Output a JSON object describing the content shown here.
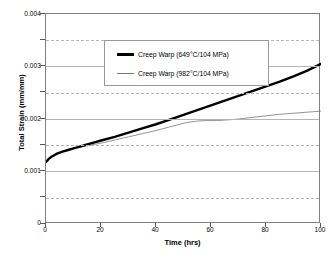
{
  "figure": {
    "background": "#ffffff",
    "frame_color": "#808080",
    "grid_major_color": "#b4b4b4",
    "grid_minor_color": "#b4b4b4"
  },
  "axes": {
    "x_title": "Time (hrs)",
    "y_title": "Total Strain (mm/mm)",
    "x_ticks": [
      "0",
      "20",
      "40",
      "60",
      "80",
      "100"
    ],
    "y_ticks": [
      "0",
      "0.001",
      "0.002",
      "0.003",
      "0.004"
    ]
  },
  "legend": {
    "entries": [
      {
        "label": "Creep Warp (649°C/104 MPa)",
        "style": "thick",
        "color": "#000000"
      },
      {
        "label": "Creep Warp (982°C/104 MPa)",
        "style": "thin",
        "color": "#777777"
      }
    ]
  },
  "caption": {
    "text": ""
  },
  "chart_data": {
    "type": "line",
    "title": "",
    "subtitle": "",
    "xlabel": "Time (hrs)",
    "ylabel": "Total Strain (mm/mm)",
    "xlim": [
      0,
      100
    ],
    "ylim": [
      0,
      0.004
    ],
    "x_ticks": [
      0,
      20,
      40,
      60,
      80,
      100
    ],
    "y_ticks": [
      0,
      0.001,
      0.002,
      0.003,
      0.004
    ],
    "y_minor_ticks": [
      0.0005,
      0.0015,
      0.0025,
      0.0035
    ],
    "grid": "major-solid-minor-dashed",
    "legend_position": "upper-left-inside",
    "series": [
      {
        "name": "Creep Warp (649°C/104 MPa)",
        "color": "#000000",
        "line_width_px": 2.4,
        "x": [
          0,
          1,
          2,
          3,
          4,
          5,
          6,
          8,
          10,
          12,
          14,
          16,
          18,
          20,
          25,
          30,
          35,
          40,
          45,
          50,
          55,
          60,
          65,
          70,
          75,
          80,
          85,
          90,
          95,
          100
        ],
        "y": [
          0.00118,
          0.00124,
          0.00128,
          0.00131,
          0.00134,
          0.00136,
          0.00138,
          0.00141,
          0.00144,
          0.00147,
          0.0015,
          0.00153,
          0.00156,
          0.00159,
          0.00166,
          0.00174,
          0.00182,
          0.0019,
          0.00199,
          0.00208,
          0.00217,
          0.00226,
          0.00235,
          0.00244,
          0.00253,
          0.00262,
          0.00271,
          0.00281,
          0.00292,
          0.00305
        ]
      },
      {
        "name": "Creep Warp (982°C/104 MPa)",
        "color": "#777777",
        "line_width_px": 0.8,
        "x": [
          0,
          1,
          2,
          3,
          4,
          5,
          6,
          8,
          10,
          12,
          14,
          16,
          18,
          20,
          25,
          30,
          35,
          40,
          45,
          48,
          50,
          52,
          55,
          58,
          60,
          62,
          65,
          68,
          70,
          75,
          80,
          85,
          90,
          95,
          100
        ],
        "y": [
          0.00118,
          0.00124,
          0.00128,
          0.00131,
          0.00134,
          0.00136,
          0.00138,
          0.00141,
          0.00144,
          0.00146,
          0.00148,
          0.0015,
          0.00152,
          0.00154,
          0.0016,
          0.00166,
          0.00172,
          0.00178,
          0.00185,
          0.00189,
          0.00192,
          0.00194,
          0.00196,
          0.00197,
          0.00197,
          0.00197,
          0.00198,
          0.00199,
          0.002,
          0.00203,
          0.00206,
          0.00209,
          0.00211,
          0.00213,
          0.00215
        ]
      }
    ]
  }
}
